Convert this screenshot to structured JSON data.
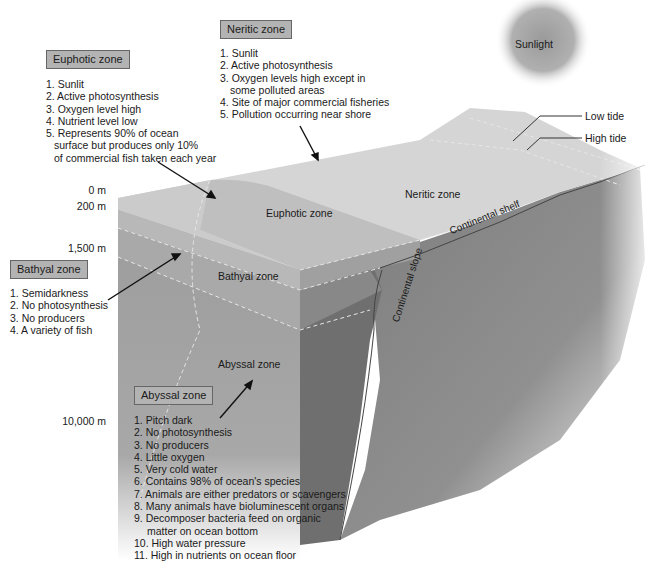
{
  "colors": {
    "surface_euphotic": "#c8c8c8",
    "neritic": "#d6d6d6",
    "bathyal": "#a8a8a8",
    "abyssal": "#9a9a9a",
    "seafloor": "#8c8c8c",
    "label_box": "#b3b3b3"
  },
  "sunlight": {
    "label": "Sunlight"
  },
  "tides": {
    "low": "Low tide",
    "high": "High tide"
  },
  "depths": [
    "0 m",
    "200 m",
    "1,500 m",
    "10,000 m"
  ],
  "in_diagram_labels": {
    "euphotic": "Euphotic zone",
    "neritic": "Neritic zone",
    "bathyal": "Bathyal zone",
    "abyssal": "Abyssal zone",
    "continental_shelf": "Continental shelf",
    "continental_slope": "Continental slope"
  },
  "callouts": {
    "euphotic": {
      "title": "Euphotic zone",
      "items": [
        "1. Sunlit",
        "2. Active photosynthesis",
        "3. Oxygen level high",
        "4. Nutrient level low",
        "5. Represents 90% of ocean",
        "surface but produces only 10%",
        "of commercial fish taken each year"
      ]
    },
    "neritic": {
      "title": "Neritic zone",
      "items": [
        "1. Sunlit",
        "2. Active photosynthesis",
        "3. Oxygen levels high except in",
        "some polluted areas",
        "4. Site of major commercial fisheries",
        "5. Pollution occurring near shore"
      ]
    },
    "bathyal": {
      "title": "Bathyal zone",
      "items": [
        "1. Semidarkness",
        "2. No photosynthesis",
        "3. No producers",
        "4. A variety of fish"
      ]
    },
    "abyssal": {
      "title": "Abyssal zone",
      "items": [
        "1. Pitch dark",
        "2. No photosynthesis",
        "3. No producers",
        "4. Little oxygen",
        "5. Very cold water",
        "6. Contains 98% of ocean's species",
        "7. Animals are either predators or scavengers",
        "8. Many animals have bioluminescent organs",
        "9. Decomposer bacteria feed on organic",
        "matter on ocean bottom",
        "10. High water pressure",
        "11. High in nutrients on ocean floor"
      ]
    }
  }
}
